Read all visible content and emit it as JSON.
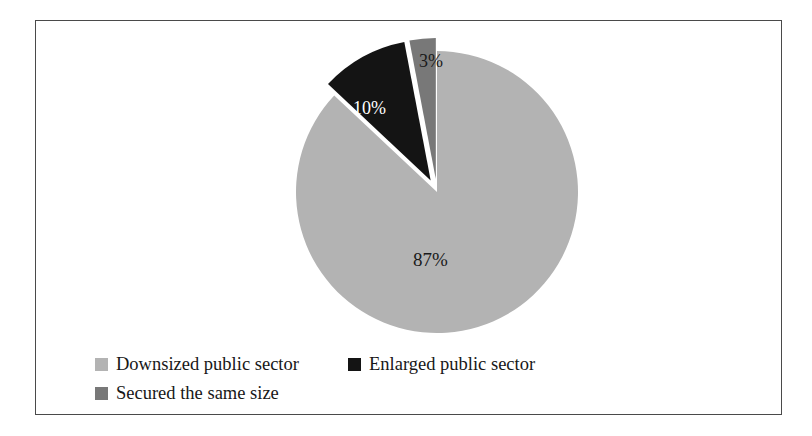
{
  "chart_data": {
    "type": "pie",
    "title": "",
    "subtitle": "",
    "xlabel": "",
    "ylabel": "",
    "grid": false,
    "legend_position": "bottom-left",
    "start_angle_deg": 0,
    "direction": "clockwise",
    "categories": [
      "Downsized public sector",
      "Enlarged public sector",
      "Secured the same size"
    ],
    "values": [
      87,
      10,
      3
    ],
    "value_unit": "%",
    "data_labels": [
      "87%",
      "10%",
      "3%"
    ],
    "slice_colors": [
      "#b3b3b3",
      "#141414",
      "#787878"
    ],
    "exploded": [
      false,
      true,
      true
    ],
    "slices": [
      {
        "label": "Downsized public sector",
        "value": 87,
        "data_label": "87%",
        "color": "#b3b3b3",
        "label_color": "#1a1a1a",
        "exploded": false
      },
      {
        "label": "Enlarged public sector",
        "value": 10,
        "data_label": "10%",
        "color": "#141414",
        "label_color": "#ffffff",
        "exploded": true
      },
      {
        "label": "Secured the same size",
        "value": 3,
        "data_label": "3%",
        "color": "#787878",
        "label_color": "#1a1a1a",
        "exploded": true
      }
    ]
  },
  "labels": {
    "slice_87": "87%",
    "slice_10": "10%",
    "slice_3": "3%"
  },
  "legend": {
    "items": [
      {
        "label": "Downsized public sector",
        "color": "#b3b3b3"
      },
      {
        "label": "Enlarged public sector",
        "color": "#141414"
      },
      {
        "label": "Secured the same size",
        "color": "#787878"
      }
    ]
  },
  "frame": {
    "border_color": "#4a4a4a",
    "background": "#ffffff"
  }
}
